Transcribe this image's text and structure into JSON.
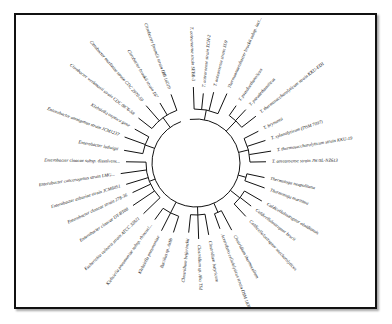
{
  "figure": {
    "type": "circular-phylogenetic-tree",
    "frame_color": "#111111",
    "line_color": "#111111",
    "center": [
      196,
      163
    ],
    "inner_radius": 44,
    "leaf_start_radius": 70,
    "label_radius": 76,
    "leaves": [
      {
        "label": "Thermotoga neapolitana",
        "angle": 12
      },
      {
        "label": "Thermotoga maritima",
        "angle": 20
      },
      {
        "label": "Caldicellulosiruptor obsidiansis",
        "angle": 30
      },
      {
        "label": "Caldicellulosiruptor bescii",
        "angle": 38
      },
      {
        "label": "Caldicellulosiruptor saccharolyticus",
        "angle": 47
      },
      {
        "label": "Clostridium thermocellum",
        "angle": 62
      },
      {
        "label": "Acetivibrio cellulolyticus strain DSM 1838",
        "angle": 70
      },
      {
        "label": "Clostridium butyricum",
        "angle": 80
      },
      {
        "label": "Clostridium sp. Aha TSd",
        "angle": 88
      },
      {
        "label": "Clostridium beijerinckii",
        "angle": 96
      },
      {
        "label": "Bacillus sp. Ashb",
        "angle": 108
      },
      {
        "label": "Klebsiella pneumoniae",
        "angle": 117
      },
      {
        "label": "Klebsiella pneumoniae subsp. rhinoscl...",
        "angle": 126
      },
      {
        "label": "Escherichia vulneris strain ATCC 33821",
        "angle": 136
      },
      {
        "label": "Enterobacter cloacae DT-BT08",
        "angle": 146
      },
      {
        "label": "Enterobacter cloacae strain 278-36",
        "angle": 155
      },
      {
        "label": "Enterobacter asburiae strain JCM6051",
        "angle": 163
      },
      {
        "label": "Enterobacter cancerogenus strain LMG...",
        "angle": 172
      },
      {
        "label": "Enterobacter cloacae subsp. dissolvens...",
        "angle": 181
      },
      {
        "label": "Enterobacter ludwigii",
        "angle": 190
      },
      {
        "label": "Enterobacter amnigenus strain JCM1237",
        "angle": 200
      },
      {
        "label": "Klebsiella oxytoca gene",
        "angle": 209
      },
      {
        "label": "Citrobacter werkmanii strain CDC 0876-58",
        "angle": 218
      },
      {
        "label": "Citrobacter murliniae strain CDC 2970-59",
        "angle": 229
      },
      {
        "label": "Citrobacter braakii strain 167",
        "angle": 239
      },
      {
        "label": "Citrobacter freundii strain IBB 16019",
        "angle": 250
      },
      {
        "label": "T. aotearoense strain SEBR-3",
        "angle": 268
      },
      {
        "label": "T. aotearoense strain XCH-2",
        "angle": 276
      },
      {
        "label": "T. aotearoense strain SL9",
        "angle": 284
      },
      {
        "label": "Thermoanaerobacter brockii subsp. lact...",
        "angle": 294
      },
      {
        "label": "T. pseudoethanolicus",
        "angle": 305
      },
      {
        "label": "T. pseudethanolicus",
        "angle": 313
      },
      {
        "label": "T. thermosaccharolyticum strain KKU-ED1",
        "angle": 322
      },
      {
        "label": "T. brynantii",
        "angle": 333
      },
      {
        "label": "T. xylanolyticum (DSM 7097)",
        "angle": 342
      },
      {
        "label": "T. thermosaccharolyticum strain KKU-19",
        "angle": 351
      },
      {
        "label": "T. aotearoense strain JW/SL-NZ613",
        "angle": 359
      }
    ]
  }
}
